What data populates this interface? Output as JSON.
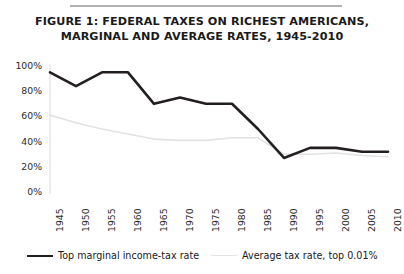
{
  "figure": {
    "title_line1": "FIGURE 1: FEDERAL TAXES ON RICHEST AMERICANS,",
    "title_line2": "MARGINAL AND AVERAGE RATES, 1945-2010"
  },
  "legend": {
    "items": [
      {
        "label": "Top marginal income-tax rate",
        "color": "#231f20",
        "swatch": "thick-line-swatch"
      },
      {
        "label": "Average tax rate, top 0.01%",
        "color": "#e2e2e2",
        "swatch": "thin-line-swatch"
      }
    ]
  },
  "chart_data": {
    "type": "line",
    "title": "FIGURE 1: FEDERAL TAXES ON RICHEST AMERICANS, MARGINAL AND AVERAGE RATES, 1945-2010",
    "xlabel": "",
    "ylabel": "",
    "categories": [
      1945,
      1950,
      1955,
      1960,
      1965,
      1970,
      1975,
      1980,
      1985,
      1990,
      1995,
      2000,
      2005,
      2010
    ],
    "x_tick_labels": [
      "1945",
      "1950",
      "1955",
      "1960",
      "1965",
      "1970",
      "1975",
      "1980",
      "1985",
      "1990",
      "1995",
      "2000",
      "2005",
      "2010"
    ],
    "y_tick_labels": [
      "0%",
      "20%",
      "40%",
      "60%",
      "80%",
      "100%"
    ],
    "y_ticks": [
      0,
      20,
      40,
      60,
      80,
      100
    ],
    "ylim": [
      0,
      100
    ],
    "xlim": [
      1945,
      2010
    ],
    "grid": false,
    "legend_position": "bottom",
    "series": [
      {
        "name": "Top marginal income-tax rate",
        "color": "#231f20",
        "width": 2.6,
        "values": [
          95,
          84,
          95,
          95,
          70,
          75,
          70,
          70,
          50,
          27,
          35,
          35,
          32,
          32
        ]
      },
      {
        "name": "Average tax rate, top 0.01%",
        "color": "#e2e2e2",
        "width": 1.6,
        "values": [
          61,
          55,
          50,
          46,
          42,
          41,
          41,
          43,
          43,
          30,
          30,
          31,
          29,
          28
        ]
      }
    ]
  }
}
